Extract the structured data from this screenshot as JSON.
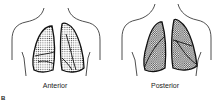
{
  "figure": {
    "panel_label": "B",
    "views": [
      {
        "id": "anterior",
        "label": "Anterior"
      },
      {
        "id": "posterior",
        "label": "Posterior"
      }
    ],
    "colors": {
      "outline": "#1a1a1a",
      "stipple": "#555555",
      "background": "#ffffff"
    }
  }
}
